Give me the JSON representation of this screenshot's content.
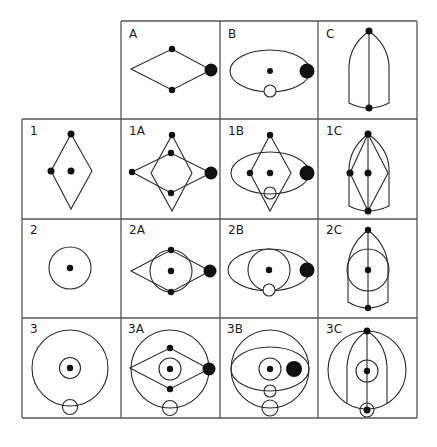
{
  "figure": {
    "grid": {
      "columns": [
        "",
        "A",
        "B",
        "C"
      ],
      "rows": [
        "",
        "1",
        "2",
        "3"
      ],
      "line_color": "#555555",
      "shape_color": "#2a2a2a"
    },
    "cells": {
      "A": {
        "label": "A",
        "content": "horizontal rhombus with dots on top and bottom vertices and a large dot on the right vertex"
      },
      "B": {
        "label": "B",
        "content": "horizontal ellipse with central dot, large dot at right edge, open circle at bottom"
      },
      "C": {
        "label": "C",
        "content": "pointed arch (bullet) shape with vertical axis and dots at top and bottom"
      },
      "1": {
        "label": "1",
        "content": "vertical rhombus with dots at top, left vertex and center"
      },
      "1A": {
        "label": "1A",
        "content": "vertical rhombus overlaid with horizontal rhombus of A"
      },
      "1B": {
        "label": "1B",
        "content": "vertical rhombus overlaid with ellipse of B"
      },
      "1C": {
        "label": "1C",
        "content": "vertical rhombus inside arch shape of C"
      },
      "2": {
        "label": "2",
        "content": "circle with central dot"
      },
      "2A": {
        "label": "2A",
        "content": "circle overlaid with horizontal rhombus of A"
      },
      "2B": {
        "label": "2B",
        "content": "circle overlaid with ellipse of B"
      },
      "2C": {
        "label": "2C",
        "content": "circle overlaid with arch shape of C"
      },
      "3": {
        "label": "3",
        "content": "large circle with inner ring and dot, small circle at bottom"
      },
      "3A": {
        "label": "3A",
        "content": "large circle with rhombus of A"
      },
      "3B": {
        "label": "3B",
        "content": "large circle with ellipse of B"
      },
      "3C": {
        "label": "3C",
        "content": "large circle with arch of C"
      }
    }
  }
}
